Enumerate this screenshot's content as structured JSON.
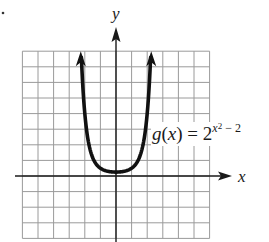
{
  "chart_data": {
    "type": "line",
    "title": "",
    "xlabel": "x",
    "ylabel": "y",
    "xlim": [
      -6,
      6
    ],
    "ylim": [
      -4,
      8
    ],
    "grid": true,
    "grid_step": 1,
    "tick_labels": false,
    "series": [
      {
        "name": "g(x) = 2^(x^2 - 2)",
        "function": "2^(x^2-2)",
        "x": [
          -2.23,
          -2.0,
          -1.75,
          -1.5,
          -1.25,
          -1.0,
          -0.75,
          -0.5,
          -0.25,
          0.0,
          0.25,
          0.5,
          0.75,
          1.0,
          1.25,
          1.5,
          1.75,
          2.0,
          2.23
        ],
        "values": [
          7.9,
          4.0,
          2.13,
          1.19,
          0.74,
          0.5,
          0.37,
          0.3,
          0.26,
          0.25,
          0.26,
          0.3,
          0.37,
          0.5,
          0.74,
          1.19,
          2.13,
          4.0,
          7.9
        ],
        "end_arrows": true
      }
    ],
    "annotations": [
      {
        "text": "g(x) = 2^(x^2 - 2)",
        "x": 2.3,
        "y": 2.3
      }
    ],
    "legend": "none"
  },
  "labels": {
    "x_axis": "x",
    "y_axis": "y",
    "func_prefix": "g",
    "func_paren_open": "(",
    "func_var": "x",
    "func_paren_close": ")",
    "func_equals": " = 2",
    "func_exp_var": "x",
    "func_exp_sq": "2",
    "func_exp_rest": " − 2"
  },
  "colors": {
    "grid": "#9a9a9a",
    "axis": "#1a1a1a",
    "curve": "#111111",
    "background": "#ffffff"
  }
}
